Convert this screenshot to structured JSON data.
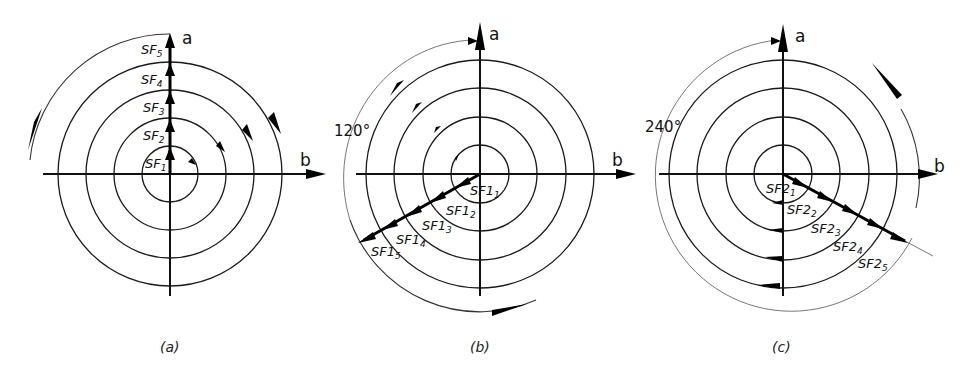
{
  "figure": {
    "panels": [
      {
        "id": "a",
        "caption": "(a)",
        "axis_a": "a",
        "axis_b": "b",
        "angle_label": "",
        "vector_prefix": "SF",
        "vector_labels": [
          {
            "base": "SF",
            "sub": "1"
          },
          {
            "base": "SF",
            "sub": "2"
          },
          {
            "base": "SF",
            "sub": "3"
          },
          {
            "base": "SF",
            "sub": "4"
          },
          {
            "base": "SF",
            "sub": "5"
          }
        ],
        "vector_direction_deg": 90
      },
      {
        "id": "b",
        "caption": "(b)",
        "axis_a": "a",
        "axis_b": "b",
        "angle_label": "120°",
        "vector_labels": [
          {
            "base": "SF1",
            "sub": "1"
          },
          {
            "base": "SF1",
            "sub": "2"
          },
          {
            "base": "SF1",
            "sub": "3"
          },
          {
            "base": "SF1",
            "sub": "4"
          },
          {
            "base": "SF1",
            "sub": "5"
          }
        ],
        "vector_direction_deg": 210
      },
      {
        "id": "c",
        "caption": "(c)",
        "axis_a": "a",
        "axis_b": "b",
        "angle_label": "240°",
        "vector_labels": [
          {
            "base": "SF2",
            "sub": "1"
          },
          {
            "base": "SF2",
            "sub": "2"
          },
          {
            "base": "SF2",
            "sub": "3"
          },
          {
            "base": "SF2",
            "sub": "4"
          },
          {
            "base": "SF2",
            "sub": "5"
          }
        ],
        "vector_direction_deg": 330
      }
    ],
    "ring_count": 4,
    "colors": {
      "ink": "#111111",
      "background": "#ffffff"
    }
  }
}
